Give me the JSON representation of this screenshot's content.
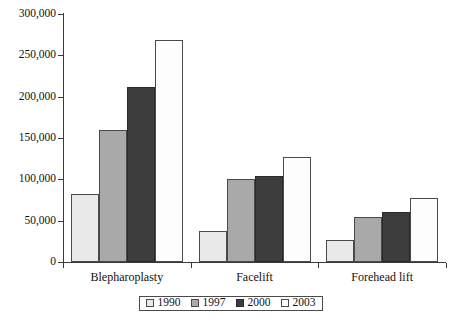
{
  "chart_data": {
    "type": "bar",
    "title": "",
    "subtitle": "",
    "xlabel": "",
    "ylabel": "",
    "categories": [
      "Blepharoplasty",
      "Facelift",
      "Forehead lift"
    ],
    "series": [
      {
        "name": "1990",
        "color": "#e9e9e9",
        "values": [
          82000,
          37000,
          27000
        ]
      },
      {
        "name": "1997",
        "color": "#a9a9a9",
        "values": [
          160000,
          101000,
          55000
        ]
      },
      {
        "name": "2000",
        "color": "#3d3d3d",
        "values": [
          212000,
          104000,
          61000
        ]
      },
      {
        "name": "2003",
        "color": "#fdfdfd",
        "values": [
          268000,
          127000,
          78000
        ]
      }
    ],
    "ylim": [
      0,
      300000
    ],
    "ytick_values": [
      0,
      50000,
      100000,
      150000,
      200000,
      250000,
      300000
    ],
    "ytick_labels": [
      "0",
      "50,000",
      "100,000",
      "150,000",
      "200,000",
      "250,000",
      "300,000"
    ],
    "grid": false,
    "legend_position": "bottom",
    "legend_boxed": true
  }
}
